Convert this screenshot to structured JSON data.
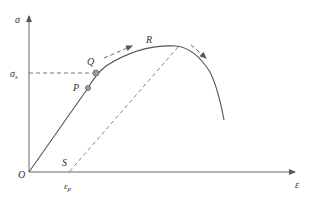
{
  "diagram": {
    "labels": {
      "y_axis": "σ",
      "x_axis": "ε",
      "yield_stress": "σ",
      "yield_stress_sub": "s",
      "origin": "O",
      "point_p": "P",
      "point_q": "Q",
      "point_r": "R",
      "point_s": "S",
      "plastic_strain": "ε",
      "plastic_strain_sub": "p"
    },
    "colors": {
      "line": "#555555",
      "dashed": "#666666",
      "point_fill": "#999999"
    }
  }
}
